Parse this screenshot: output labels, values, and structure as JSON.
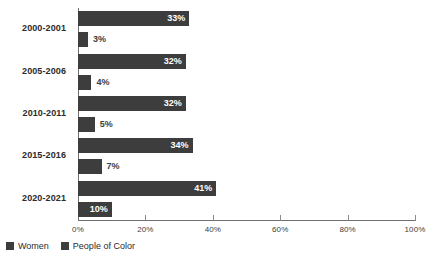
{
  "chart_data": {
    "type": "bar",
    "orientation": "horizontal",
    "title": "",
    "subtitle": "",
    "xlabel": "",
    "ylabel": "",
    "xlim": [
      0,
      100
    ],
    "grid": false,
    "legend_position": "bottom-left",
    "categories": [
      "2000-2001",
      "2005-2006",
      "2010-2011",
      "2015-2016",
      "2020-2021"
    ],
    "tick_labels": [
      "0%",
      "20%",
      "40%",
      "60%",
      "80%",
      "100%"
    ],
    "tick_values": [
      0,
      20,
      40,
      60,
      80,
      100
    ],
    "series": [
      {
        "name": "Women",
        "color": "#3d3d3d",
        "values": [
          33,
          32,
          32,
          34,
          41
        ],
        "labels": [
          "33%",
          "32%",
          "32%",
          "34%",
          "41%"
        ]
      },
      {
        "name": "People of Color",
        "color": "#3d3d3d",
        "values": [
          3,
          4,
          5,
          7,
          10
        ],
        "labels": [
          "3%",
          "4%",
          "5%",
          "7%",
          "10%"
        ]
      }
    ]
  },
  "legend": {
    "items": [
      {
        "label": "Women",
        "color": "#3d3d3d"
      },
      {
        "label": "People of Color",
        "color": "#3d3d3d"
      }
    ]
  },
  "axis": {
    "line_color": "#6f6f6f",
    "tick_color": "#8a8a8a"
  }
}
